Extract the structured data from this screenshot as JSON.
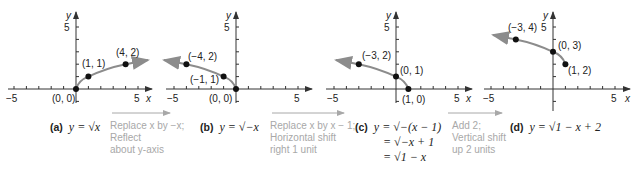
{
  "panels": [
    {
      "id": "a",
      "label": "(a)",
      "equation": "y = √x",
      "points": [
        {
          "x": 0,
          "y": 0,
          "label": "(0, 0)"
        },
        {
          "x": 1,
          "y": 1,
          "label": "(1, 1)"
        },
        {
          "x": 4,
          "y": 2,
          "label": "(4, 2)"
        }
      ]
    },
    {
      "id": "b",
      "label": "(b)",
      "equation": "y = √−x",
      "points": [
        {
          "x": 0,
          "y": 0,
          "label": "(0, 0)"
        },
        {
          "x": -1,
          "y": 1,
          "label": "(−1, 1)"
        },
        {
          "x": -4,
          "y": 2,
          "label": "(−4, 2)"
        }
      ]
    },
    {
      "id": "c",
      "label": "(c)",
      "equation_lines": [
        "y = √−(x − 1)",
        "= √−x + 1",
        "= √1 − x"
      ],
      "points": [
        {
          "x": 1,
          "y": 0,
          "label": "(1, 0)"
        },
        {
          "x": 0,
          "y": 1,
          "label": "(0, 1)"
        },
        {
          "x": -3,
          "y": 2,
          "label": "(−3, 2)"
        }
      ]
    },
    {
      "id": "d",
      "label": "(d)",
      "equation": "y = √1 − x + 2",
      "points": [
        {
          "x": 1,
          "y": 2,
          "label": "(1, 2)"
        },
        {
          "x": 0,
          "y": 3,
          "label": "(0, 3)"
        },
        {
          "x": -3,
          "y": 4,
          "label": "(−3, 4)"
        }
      ]
    }
  ],
  "transforms": [
    {
      "lines": [
        "Replace x by −x;",
        "Reflect",
        "about y-axis"
      ]
    },
    {
      "lines": [
        "Replace x by x − 1;",
        "Horizontal shift",
        "right 1 unit"
      ]
    },
    {
      "lines": [
        "Add 2;",
        "Vertical shift",
        "up 2 units"
      ]
    }
  ],
  "axes": {
    "x_label": "x",
    "y_label": "y",
    "x_min_tick": "−5",
    "x_max_tick": "5",
    "y_max_tick": "5"
  },
  "colors": {
    "curve": "#8c8c8c",
    "axis": "#333333",
    "point": "#111111",
    "note": "#a8a8a8"
  }
}
